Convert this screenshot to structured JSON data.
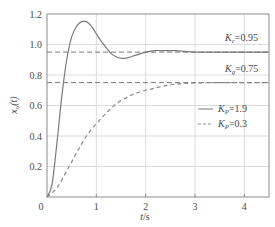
{
  "chart_data": {
    "type": "line",
    "title": "",
    "xlabel": "t/s",
    "ylabel": "x_o(t)",
    "xlim": [
      0,
      4.5
    ],
    "ylim": [
      0,
      1.2
    ],
    "grid": true,
    "xticks": [
      0,
      1,
      2,
      3,
      4
    ],
    "xtick_labels": [
      "0",
      "1",
      "2",
      "3",
      "4"
    ],
    "yticks": [
      0.2,
      0.4,
      0.6,
      0.8,
      1.0,
      1.2
    ],
    "ytick_labels": [
      "0.2",
      "0.4",
      "0.6",
      "0.8",
      "1.0",
      "1.2"
    ],
    "legend_position": "right-middle",
    "series": [
      {
        "name": "K_P=1.9",
        "style": "solid",
        "color": "#7a7a7a",
        "x": [
          0,
          0.1,
          0.2,
          0.3,
          0.4,
          0.5,
          0.6,
          0.7,
          0.8,
          0.9,
          1.0,
          1.1,
          1.2,
          1.3,
          1.4,
          1.5,
          1.6,
          1.7,
          1.8,
          2.0,
          2.2,
          2.4,
          2.6,
          2.8,
          3.0,
          3.5,
          4.0,
          4.5
        ],
        "y": [
          0,
          0.08,
          0.35,
          0.66,
          0.9,
          1.05,
          1.12,
          1.15,
          1.15,
          1.12,
          1.07,
          1.02,
          0.98,
          0.94,
          0.92,
          0.91,
          0.91,
          0.92,
          0.93,
          0.95,
          0.96,
          0.96,
          0.96,
          0.955,
          0.95,
          0.95,
          0.95,
          0.95
        ]
      },
      {
        "name": "K_P=0.3",
        "style": "dashed",
        "color": "#8a8a8a",
        "x": [
          0,
          0.2,
          0.4,
          0.6,
          0.8,
          1.0,
          1.2,
          1.4,
          1.6,
          1.8,
          2.0,
          2.2,
          2.4,
          2.6,
          2.8,
          3.0,
          3.5,
          4.0,
          4.5
        ],
        "y": [
          0,
          0.06,
          0.17,
          0.29,
          0.4,
          0.48,
          0.55,
          0.61,
          0.65,
          0.68,
          0.7,
          0.715,
          0.73,
          0.74,
          0.745,
          0.748,
          0.75,
          0.75,
          0.75
        ]
      }
    ],
    "reference_lines": [
      {
        "y": 0.95,
        "label": "K_c=0.95",
        "style": "dashed"
      },
      {
        "y": 0.75,
        "label": "K_g=0.75",
        "style": "dashed"
      }
    ]
  },
  "labels": {
    "origin": "0",
    "xlabel_t": "t",
    "xlabel_unit": "/s",
    "ylabel_x": "x",
    "ylabel_sub": "o",
    "ylabel_arg": "(t)",
    "ref1_K": "K",
    "ref1_sub": "c",
    "ref1_val": "=0.95",
    "ref2_K": "K",
    "ref2_sub": "g",
    "ref2_val": "=0.75",
    "legend1_K": "K",
    "legend1_sub": "P",
    "legend1_val": "=1.9",
    "legend2_K": "K",
    "legend2_sub": "P",
    "legend2_val": "=0.3"
  }
}
